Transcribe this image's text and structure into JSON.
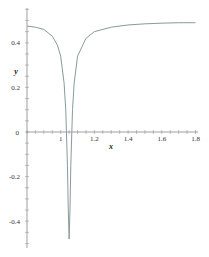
{
  "chart_data": {
    "type": "line",
    "title": "",
    "xlabel": "x",
    "ylabel": "y",
    "xlim": [
      0.8,
      1.8
    ],
    "ylim": [
      -0.5,
      0.55
    ],
    "grid": false,
    "legend": null,
    "x_ticks": [
      "1",
      "1.2",
      "1.4",
      "1.6",
      "1.8"
    ],
    "y_ticks": [
      "0.4",
      "0.2",
      "0",
      "-0.2",
      "-0.4"
    ],
    "origin_label": "0",
    "series": [
      {
        "name": "y(x)",
        "color": "#8a9a9a",
        "x": [
          0.8,
          0.85,
          0.9,
          0.95,
          0.98,
          1.0,
          1.02,
          1.03,
          1.04,
          1.045,
          1.05,
          1.055,
          1.06,
          1.07,
          1.08,
          1.1,
          1.15,
          1.2,
          1.3,
          1.4,
          1.5,
          1.6,
          1.7,
          1.8
        ],
        "values": [
          0.475,
          0.47,
          0.46,
          0.43,
          0.39,
          0.34,
          0.22,
          0.1,
          -0.15,
          -0.35,
          -0.48,
          -0.35,
          -0.15,
          0.1,
          0.22,
          0.34,
          0.42,
          0.45,
          0.47,
          0.48,
          0.485,
          0.488,
          0.49,
          0.49
        ]
      }
    ]
  },
  "axes": {
    "x_label": "x",
    "y_label": "y",
    "origin_label": "0"
  }
}
